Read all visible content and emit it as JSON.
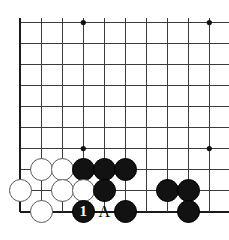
{
  "figure": {
    "kind": "go-board-diagram",
    "title": "",
    "board": {
      "background_color": "#ffffff",
      "line_color": "#3c3c3c",
      "edge_line_color": "#1a1a1a",
      "origin_x": 20.3,
      "origin_y": 22.6,
      "spacing": 21.0,
      "columns": 10,
      "rows": 10,
      "edge_sides": [
        "left",
        "bottom"
      ],
      "star_point_color": "#111111",
      "star_point_radius": 2.6,
      "star_points": [
        {
          "col": 3,
          "row": 0
        },
        {
          "col": 9,
          "row": 0
        },
        {
          "col": 3,
          "row": 6
        },
        {
          "col": 9,
          "row": 6
        }
      ]
    },
    "stone_radius": 11.6,
    "stones": [
      {
        "id": "w1",
        "color": "white",
        "col": 1,
        "row": 7
      },
      {
        "id": "w2",
        "color": "white",
        "col": 2,
        "row": 7
      },
      {
        "id": "b1",
        "color": "black",
        "col": 3,
        "row": 7
      },
      {
        "id": "b2",
        "color": "black",
        "col": 4,
        "row": 7
      },
      {
        "id": "b3",
        "color": "black",
        "col": 5,
        "row": 7
      },
      {
        "id": "w3",
        "color": "white",
        "col": 0,
        "row": 8
      },
      {
        "id": "w4",
        "color": "white",
        "col": 2,
        "row": 8
      },
      {
        "id": "w5",
        "color": "white",
        "col": 3,
        "row": 8
      },
      {
        "id": "b4",
        "color": "black",
        "col": 4,
        "row": 8
      },
      {
        "id": "b5",
        "color": "black",
        "col": 7,
        "row": 8
      },
      {
        "id": "b6",
        "color": "black",
        "col": 8,
        "row": 8
      },
      {
        "id": "w6",
        "color": "white",
        "col": 1,
        "row": 9
      },
      {
        "id": "b7",
        "color": "black",
        "col": 3,
        "row": 9
      },
      {
        "id": "b8",
        "color": "black",
        "col": 5,
        "row": 9
      },
      {
        "id": "b9",
        "color": "black",
        "col": 8,
        "row": 9
      }
    ],
    "labels": [
      {
        "id": "move1",
        "text": "1",
        "col": 3,
        "row": 9,
        "on": "black-stone",
        "font_size": 15
      },
      {
        "id": "pointA",
        "text": "A",
        "col": 4,
        "row": 9,
        "on": "board",
        "font_size": 16
      }
    ]
  }
}
